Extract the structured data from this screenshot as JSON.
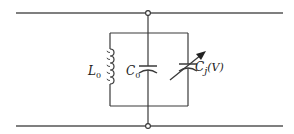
{
  "diagram": {
    "type": "circuit-schematic",
    "colors": {
      "wire": "#3a3a3a",
      "rail": "#555555",
      "background": "#ffffff"
    },
    "rails": [
      {
        "name": "top-rail",
        "y": 13
      },
      {
        "name": "bottom-rail",
        "y": 126
      }
    ],
    "components": [
      {
        "id": "inductor",
        "kind": "inductor",
        "label": "L",
        "subscript": "0"
      },
      {
        "id": "capacitor",
        "kind": "capacitor",
        "label": "C",
        "subscript": "0"
      },
      {
        "id": "varactor",
        "kind": "variable-capacitor",
        "label": "C",
        "subscript": "j",
        "suffix": "(V)"
      }
    ],
    "nodes": [
      {
        "name": "top-node"
      },
      {
        "name": "bottom-node"
      }
    ]
  }
}
